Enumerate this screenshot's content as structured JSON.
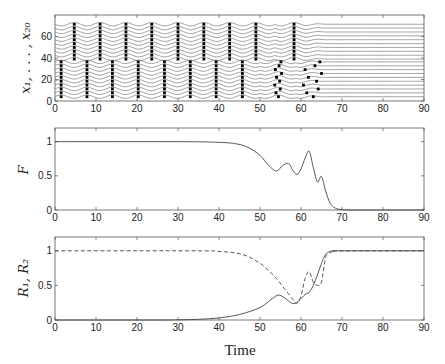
{
  "chart_data": [
    {
      "type": "line",
      "title": "",
      "xlabel": "",
      "ylabel": "x_1, ..., x_20",
      "xlim": [
        0,
        90
      ],
      "ylim": [
        0,
        80
      ],
      "xticks": [
        0,
        10,
        20,
        30,
        40,
        50,
        60,
        70,
        80,
        90
      ],
      "yticks": [
        0,
        20,
        40,
        60
      ],
      "description": "20 oscillator traces (lines) with spike dots; lower group (~0-37) spikes near t=1.5,8,14,20.5,27,33,39.5,46,54,63; upper group (~40-70) spikes near t=5,11,17.5,23.5,30,36,42.5,49,58.5; synchronized waves decay to flat lines after ~65",
      "lower_spike_times": [
        1.5,
        7.8,
        14,
        20.3,
        26.7,
        33,
        39.3,
        45.7,
        54.5,
        63
      ],
      "upper_spike_times": [
        4.7,
        11,
        17.3,
        23.6,
        30,
        36.3,
        42.6,
        49,
        58.3
      ],
      "lines_count": 20
    },
    {
      "type": "line",
      "title": "",
      "xlabel": "",
      "ylabel": "F",
      "xlim": [
        0,
        90
      ],
      "ylim": [
        0,
        1.2
      ],
      "xticks": [
        0,
        10,
        20,
        30,
        40,
        50,
        60,
        70,
        80,
        90
      ],
      "yticks": [
        0,
        0.5,
        1
      ],
      "series": [
        {
          "name": "F",
          "style": "solid",
          "x": [
            0,
            30,
            40,
            44,
            47,
            50,
            52,
            54,
            55.5,
            57,
            58,
            59,
            60,
            61,
            62,
            63,
            64,
            65,
            66,
            67,
            68,
            70,
            75,
            90
          ],
          "y": [
            1,
            1,
            0.99,
            0.97,
            0.92,
            0.8,
            0.66,
            0.57,
            0.65,
            0.68,
            0.58,
            0.52,
            0.6,
            0.76,
            0.86,
            0.62,
            0.41,
            0.49,
            0.28,
            0.11,
            0.04,
            0.005,
            0,
            0
          ]
        }
      ]
    },
    {
      "type": "line",
      "title": "",
      "xlabel": "Time",
      "ylabel": "R1, R2",
      "xlim": [
        0,
        90
      ],
      "ylim": [
        0,
        1.2
      ],
      "xticks": [
        0,
        10,
        20,
        30,
        40,
        50,
        60,
        70,
        80,
        90
      ],
      "yticks": [
        0,
        0.5,
        1
      ],
      "series": [
        {
          "name": "R1",
          "style": "solid",
          "x": [
            0,
            25,
            30,
            35,
            40,
            45,
            50,
            53,
            54.5,
            56,
            57.5,
            58.5,
            59.5,
            61,
            62,
            63,
            64,
            65,
            66,
            67,
            68,
            70,
            90
          ],
          "y": [
            0,
            0,
            0.003,
            0.01,
            0.03,
            0.08,
            0.18,
            0.31,
            0.36,
            0.32,
            0.25,
            0.24,
            0.28,
            0.37,
            0.4,
            0.5,
            0.65,
            0.82,
            0.95,
            0.99,
            1,
            1,
            1
          ]
        },
        {
          "name": "R2",
          "style": "dashed",
          "x": [
            0,
            35,
            40,
            44,
            47,
            50,
            52,
            54,
            56,
            58,
            59,
            60,
            61,
            62,
            63,
            64,
            65,
            66,
            67,
            68,
            70,
            90
          ],
          "y": [
            1,
            1,
            0.99,
            0.97,
            0.92,
            0.82,
            0.72,
            0.6,
            0.45,
            0.3,
            0.24,
            0.35,
            0.6,
            0.7,
            0.55,
            0.5,
            0.55,
            0.9,
            0.97,
            0.99,
            1,
            1
          ]
        }
      ]
    }
  ],
  "labels": {
    "panel1_ylabel": "x₁, . . . , x₂₀",
    "panel2_ylabel": "F",
    "panel3_ylabel": "R₁, R₂",
    "xlabel": "Time"
  }
}
